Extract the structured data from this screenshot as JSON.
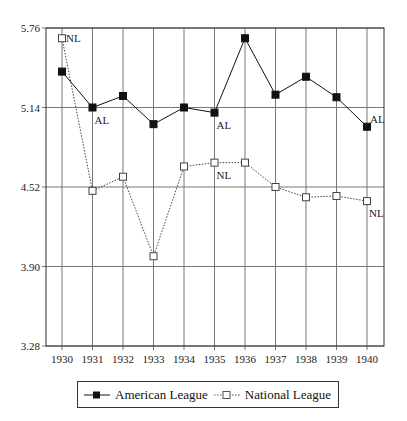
{
  "chart_data": {
    "type": "line",
    "title": "",
    "xlabel": "",
    "ylabel": "",
    "categories": [
      "1930",
      "1931",
      "1932",
      "1933",
      "1934",
      "1935",
      "1936",
      "1937",
      "1938",
      "1939",
      "1940"
    ],
    "series": [
      {
        "name": "American League",
        "marker": "filled-square",
        "line": "solid",
        "values": [
          5.42,
          5.14,
          5.23,
          5.01,
          5.14,
          5.1,
          5.68,
          5.24,
          5.38,
          5.22,
          4.99
        ],
        "point_labels": {
          "1931": "AL",
          "1935": "AL",
          "1940": "AL"
        }
      },
      {
        "name": "National League",
        "marker": "hollow-square",
        "line": "dotted",
        "values": [
          5.68,
          4.49,
          4.6,
          3.98,
          4.68,
          4.71,
          4.71,
          4.52,
          4.44,
          4.45,
          4.41
        ],
        "point_labels": {
          "1930": "NL",
          "1935": "NL",
          "1940": "NL"
        }
      }
    ],
    "y_ticks": [
      "5.76",
      "5.14",
      "4.52",
      "3.90",
      "3.28"
    ],
    "ylim": [
      3.28,
      5.76
    ],
    "grid": true,
    "legend_position": "bottom"
  },
  "legend": {
    "items": [
      {
        "label": "American League"
      },
      {
        "label": "National League"
      }
    ]
  }
}
